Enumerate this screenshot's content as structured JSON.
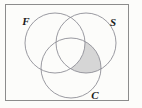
{
  "figure": {
    "type": "venn-diagram",
    "title": "",
    "background_color": "#fcfcfa",
    "universe_frame": {
      "shape": "rectangle",
      "x": 5,
      "y": 4,
      "width": 124,
      "height": 97,
      "stroke_color": "#8c8c8c",
      "fill_color": "#fcfcfa"
    },
    "circle_stroke_color": "#8e8e96",
    "shade_color": "#d6d6d6",
    "sets": [
      {
        "id": "F",
        "label": "F",
        "position": "top-left",
        "center_x": 55,
        "center_y": 43,
        "radius": 30,
        "label_x": 26,
        "label_y": 25
      },
      {
        "id": "S",
        "label": "S",
        "position": "top-right",
        "center_x": 86,
        "center_y": 43,
        "radius": 30,
        "label_x": 113,
        "label_y": 26
      },
      {
        "id": "C",
        "label": "C",
        "position": "bottom",
        "center_x": 71,
        "center_y": 68,
        "radius": 30,
        "label_x": 95,
        "label_y": 99
      }
    ],
    "shaded_regions": [
      {
        "id": "S-and-C-not-F",
        "description": "S ∩ C ∩ F'",
        "fill": "#d6d6d6"
      }
    ]
  },
  "chart_data": {
    "type": "venn",
    "title": "",
    "set_labels": [
      "F",
      "S",
      "C"
    ],
    "set_count": 3,
    "regions": [
      {
        "name": "F only",
        "shaded": false
      },
      {
        "name": "S only",
        "shaded": false
      },
      {
        "name": "C only",
        "shaded": false
      },
      {
        "name": "F and S only",
        "shaded": false
      },
      {
        "name": "S and C only",
        "shaded": true
      },
      {
        "name": "F and C only",
        "shaded": false
      },
      {
        "name": "F and S and C",
        "shaded": false
      },
      {
        "name": "outside all sets",
        "shaded": false
      }
    ],
    "shaded_expression": "S ∩ C ∩ F'",
    "legend": "none",
    "grid": false
  }
}
